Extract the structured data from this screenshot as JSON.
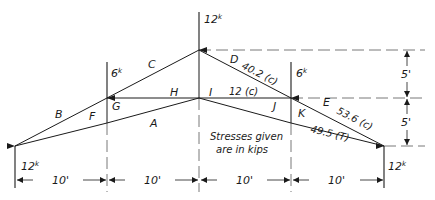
{
  "diagram": {
    "type": "roof truss stress diagram",
    "note_line1": "Stresses given",
    "note_line2": "are in kips",
    "loads": {
      "apex": "12",
      "left_panel": "6",
      "right_panel": "6",
      "unit": "k"
    },
    "reactions": {
      "left": "12",
      "right": "12",
      "unit": "k"
    },
    "space_labels": [
      "A",
      "B",
      "C",
      "D",
      "E",
      "F",
      "G",
      "H",
      "I",
      "J",
      "K"
    ],
    "member_stresses": {
      "DI": "40.2 (c)",
      "IJ": "12 (c)",
      "EK": "53.6 (c)",
      "AK": "49.5 (T)"
    },
    "horizontal_dims": [
      "10'",
      "10'",
      "10'",
      "10'"
    ],
    "vertical_dims": [
      "5'",
      "5'"
    ]
  }
}
